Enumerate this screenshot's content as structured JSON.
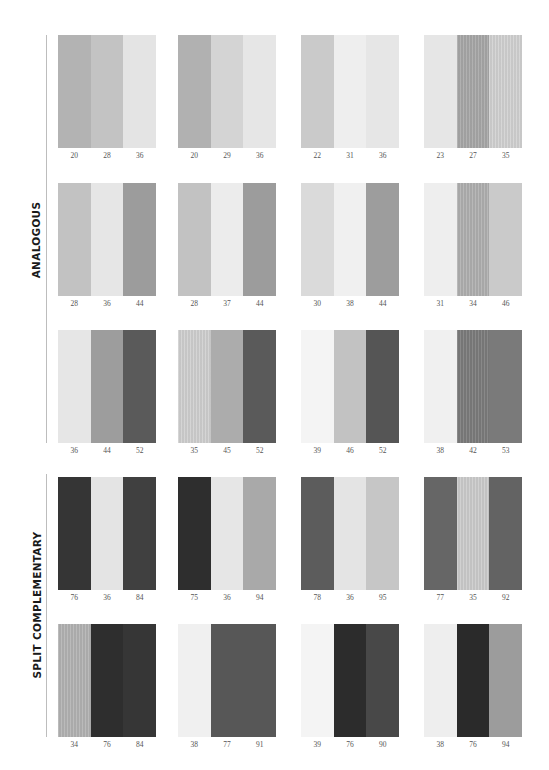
{
  "sections": [
    {
      "label": "ANALOGOUS",
      "line": {
        "top": 35,
        "height": 408
      },
      "label_center_y": 240,
      "rows": [
        {
          "top": 35,
          "groups": [
            {
              "values": [
                "20",
                "28",
                "36"
              ],
              "colors": [
                "#b3b3b3",
                "#c3c3c3",
                "#e4e4e4"
              ],
              "textured": [
                false,
                false,
                false
              ]
            },
            {
              "values": [
                "20",
                "29",
                "36"
              ],
              "colors": [
                "#b1b1b1",
                "#d4d4d4",
                "#e6e6e6"
              ],
              "textured": [
                false,
                false,
                false
              ]
            },
            {
              "values": [
                "22",
                "31",
                "36"
              ],
              "colors": [
                "#cacaca",
                "#eeeeee",
                "#e6e6e6"
              ],
              "textured": [
                false,
                false,
                false
              ]
            },
            {
              "values": [
                "23",
                "27",
                "35"
              ],
              "colors": [
                "#e6e6e6",
                "#a8a8a8",
                "#d2d2d2"
              ],
              "textured": [
                false,
                true,
                true
              ]
            }
          ]
        },
        {
          "top": 183,
          "groups": [
            {
              "values": [
                "28",
                "36",
                "44"
              ],
              "colors": [
                "#c2c2c2",
                "#e6e6e6",
                "#9c9c9c"
              ],
              "textured": [
                false,
                false,
                false
              ]
            },
            {
              "values": [
                "28",
                "37",
                "44"
              ],
              "colors": [
                "#c2c2c2",
                "#ececec",
                "#9c9c9c"
              ],
              "textured": [
                false,
                false,
                false
              ]
            },
            {
              "values": [
                "30",
                "38",
                "44"
              ],
              "colors": [
                "#dadada",
                "#f0f0f0",
                "#9d9d9d"
              ],
              "textured": [
                false,
                false,
                false
              ]
            },
            {
              "values": [
                "31",
                "34",
                "46"
              ],
              "colors": [
                "#eeeeee",
                "#b0b0b0",
                "#cacaca"
              ],
              "textured": [
                false,
                true,
                false
              ]
            }
          ]
        },
        {
          "top": 330,
          "groups": [
            {
              "values": [
                "36",
                "44",
                "52"
              ],
              "colors": [
                "#e6e6e6",
                "#9d9d9d",
                "#5a5a5a"
              ],
              "textured": [
                false,
                false,
                false
              ]
            },
            {
              "values": [
                "35",
                "45",
                "52"
              ],
              "colors": [
                "#d0d0d0",
                "#acacac",
                "#5a5a5a"
              ],
              "textured": [
                true,
                false,
                false
              ]
            },
            {
              "values": [
                "39",
                "46",
                "52"
              ],
              "colors": [
                "#f4f4f4",
                "#c2c2c2",
                "#555555"
              ],
              "textured": [
                false,
                false,
                false
              ]
            },
            {
              "values": [
                "38",
                "42",
                "53"
              ],
              "colors": [
                "#f0f0f0",
                "#7c7c7c",
                "#7a7a7a"
              ],
              "textured": [
                false,
                true,
                false
              ]
            }
          ]
        }
      ]
    },
    {
      "label": "SPLIT COMPLEMENTARY",
      "line": {
        "top": 474,
        "height": 263
      },
      "label_center_y": 605,
      "rows": [
        {
          "top": 477,
          "groups": [
            {
              "values": [
                "76",
                "36",
                "84"
              ],
              "colors": [
                "#353535",
                "#e4e4e4",
                "#404040"
              ],
              "textured": [
                false,
                false,
                false
              ]
            },
            {
              "values": [
                "75",
                "36",
                "94"
              ],
              "colors": [
                "#2e2e2e",
                "#e6e6e6",
                "#a9a9a9"
              ],
              "textured": [
                false,
                false,
                false
              ]
            },
            {
              "values": [
                "78",
                "36",
                "95"
              ],
              "colors": [
                "#5c5c5c",
                "#e4e4e4",
                "#c6c6c6"
              ],
              "textured": [
                false,
                false,
                false
              ]
            },
            {
              "values": [
                "77",
                "35",
                "92"
              ],
              "colors": [
                "#666666",
                "#cccccc",
                "#636363"
              ],
              "textured": [
                false,
                true,
                false
              ]
            }
          ]
        },
        {
          "top": 624,
          "groups": [
            {
              "values": [
                "34",
                "76",
                "84"
              ],
              "colors": [
                "#b3b3b3",
                "#2e2e2e",
                "#363636"
              ],
              "textured": [
                true,
                false,
                false
              ]
            },
            {
              "values": [
                "38",
                "77",
                "91"
              ],
              "colors": [
                "#f0f0f0",
                "#575757",
                "#575757"
              ],
              "textured": [
                false,
                false,
                false
              ]
            },
            {
              "values": [
                "39",
                "76",
                "90"
              ],
              "colors": [
                "#f4f4f4",
                "#2c2c2c",
                "#484848"
              ],
              "textured": [
                false,
                false,
                false
              ]
            },
            {
              "values": [
                "38",
                "76",
                "94"
              ],
              "colors": [
                "#eeeeee",
                "#2a2a2a",
                "#9c9c9c"
              ],
              "textured": [
                false,
                false,
                false
              ]
            }
          ]
        }
      ]
    }
  ],
  "layout": {
    "column_lefts": [
      58,
      178,
      301,
      424
    ]
  }
}
